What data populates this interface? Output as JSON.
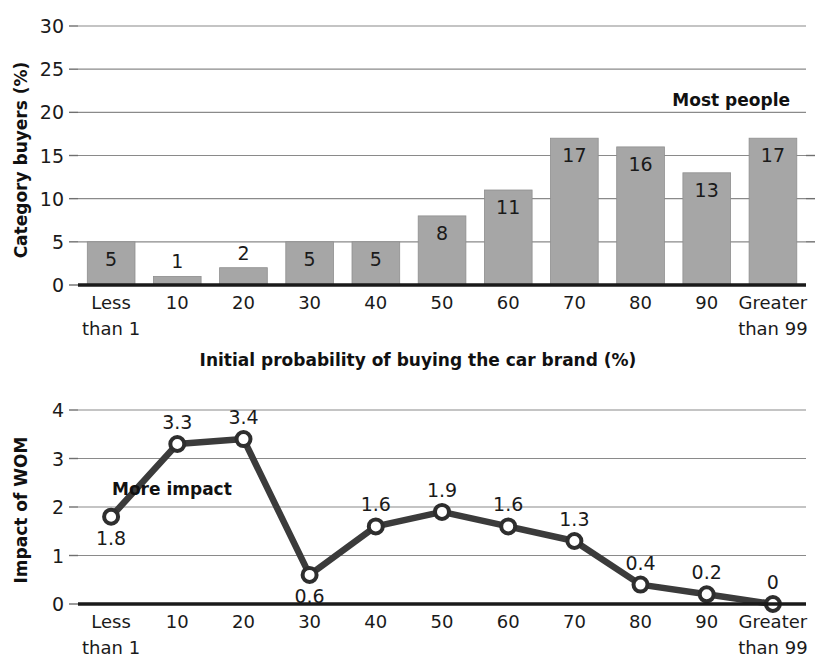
{
  "chart_data": [
    {
      "type": "bar",
      "title": "",
      "xlabel": "Initial probability of buying the car brand (%)",
      "ylabel": "Category buyers (%)",
      "categories": [
        "Less than 1",
        "10",
        "20",
        "30",
        "40",
        "50",
        "60",
        "70",
        "80",
        "90",
        "Greater than 99"
      ],
      "category_lines": [
        [
          "Less",
          "than 1"
        ],
        [
          "10",
          ""
        ],
        [
          "20",
          ""
        ],
        [
          "30",
          ""
        ],
        [
          "40",
          ""
        ],
        [
          "50",
          ""
        ],
        [
          "60",
          ""
        ],
        [
          "70",
          ""
        ],
        [
          "80",
          ""
        ],
        [
          "90",
          ""
        ],
        [
          "Greater",
          "than 99"
        ]
      ],
      "values": [
        5,
        1,
        2,
        5,
        5,
        8,
        11,
        17,
        16,
        13,
        17
      ],
      "value_labels": [
        "5",
        "1",
        "2",
        "5",
        "5",
        "8",
        "11",
        "17",
        "16",
        "13",
        "17"
      ],
      "ylim": [
        0,
        30
      ],
      "yticks": [
        0,
        5,
        10,
        15,
        20,
        25,
        30
      ],
      "ytick_labels": [
        "0",
        "5",
        "10",
        "15",
        "20",
        "25",
        "30"
      ],
      "grid": true,
      "legend": "none",
      "annotations": [
        {
          "text": "Most people",
          "near_category": "80"
        }
      ],
      "bar_color": "#a6a6a6"
    },
    {
      "type": "line",
      "title": "",
      "xlabel": "",
      "ylabel": "Impact of WOM",
      "categories": [
        "Less than 1",
        "10",
        "20",
        "30",
        "40",
        "50",
        "60",
        "70",
        "80",
        "90",
        "Greater than 99"
      ],
      "category_lines": [
        [
          "Less",
          "than 1"
        ],
        [
          "10",
          ""
        ],
        [
          "20",
          ""
        ],
        [
          "30",
          ""
        ],
        [
          "40",
          ""
        ],
        [
          "50",
          ""
        ],
        [
          "60",
          ""
        ],
        [
          "70",
          ""
        ],
        [
          "80",
          ""
        ],
        [
          "90",
          ""
        ],
        [
          "Greater",
          "than 99"
        ]
      ],
      "values": [
        1.8,
        3.3,
        3.4,
        0.6,
        1.6,
        1.9,
        1.6,
        1.3,
        0.4,
        0.2,
        0
      ],
      "value_labels": [
        "1.8",
        "3.3",
        "3.4",
        "0.6",
        "1.6",
        "1.9",
        "1.6",
        "1.3",
        "0.4",
        "0.2",
        "0"
      ],
      "label_positions": [
        "below",
        "above",
        "above",
        "below",
        "above",
        "above",
        "above",
        "above",
        "above",
        "above",
        "above"
      ],
      "ylim": [
        0,
        4
      ],
      "yticks": [
        0,
        1,
        2,
        3,
        4
      ],
      "ytick_labels": [
        "0",
        "1",
        "2",
        "3",
        "4"
      ],
      "grid": true,
      "legend": "none",
      "annotations": [
        {
          "text": "More impact",
          "near_category": "10"
        }
      ],
      "line_color": "#3b3b3b",
      "marker_fill": "#ffffff"
    }
  ],
  "top_chart": {
    "ylabel": "Category buyers (%)",
    "annotation": "Most people",
    "xaxis_title": "Initial probability of buying the car brand (%)"
  },
  "bottom_chart": {
    "ylabel": "Impact of WOM",
    "annotation": "More impact"
  }
}
